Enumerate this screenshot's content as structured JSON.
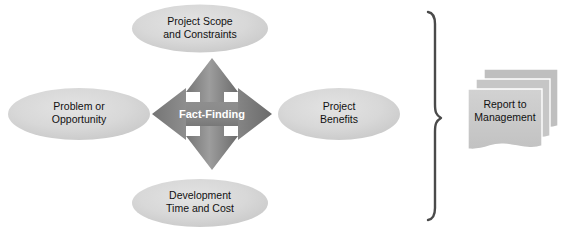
{
  "diagram": {
    "background_color": "#ffffff",
    "center": {
      "label": "Fact-Finding",
      "icon": "four-way-arrow-icon",
      "fill_light": "#9a9a9a",
      "fill_dark": "#6e6e6e",
      "text_color": "#ffffff"
    },
    "nodes": [
      {
        "id": "project-scope",
        "position": "top",
        "lines": [
          "Project Scope",
          "and Constraints"
        ],
        "shape": "ellipse",
        "fill": "#d4d4d4",
        "text_color": "#111111"
      },
      {
        "id": "problem-opportunity",
        "position": "left",
        "lines": [
          "Problem or",
          "Opportunity"
        ],
        "shape": "ellipse",
        "fill": "#d4d4d4",
        "text_color": "#111111"
      },
      {
        "id": "project-benefits",
        "position": "right",
        "lines": [
          "Project",
          "Benefits"
        ],
        "shape": "ellipse",
        "fill": "#d4d4d4",
        "text_color": "#111111"
      },
      {
        "id": "development-time-cost",
        "position": "bottom",
        "lines": [
          "Development",
          "Time and Cost"
        ],
        "shape": "ellipse",
        "fill": "#d4d4d4",
        "text_color": "#111111"
      }
    ],
    "brace": {
      "icon": "curly-brace-icon",
      "orientation": "right-pointing",
      "color": "#4a4a4a"
    },
    "output": {
      "id": "report-to-management",
      "lines": [
        "Report to",
        "Management"
      ],
      "shape": "document-stack",
      "sheet_count": 3,
      "fill": "#c9c9c9",
      "fill_back": "#bfbfbf",
      "text_color": "#111111"
    }
  }
}
